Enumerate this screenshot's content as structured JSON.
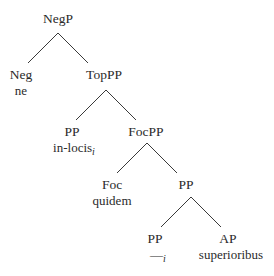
{
  "tree": {
    "nodes": [
      {
        "id": "negp",
        "label": "NegP"
      },
      {
        "id": "neg",
        "label": "Neg",
        "word": "ne"
      },
      {
        "id": "toppp",
        "label": "TopPP"
      },
      {
        "id": "pp1",
        "label": "PP",
        "word": "in-locis",
        "index": "i"
      },
      {
        "id": "focpp",
        "label": "FocPP"
      },
      {
        "id": "foc",
        "label": "Foc",
        "word": "quidem"
      },
      {
        "id": "pp2",
        "label": "PP"
      },
      {
        "id": "pp3",
        "label": "PP",
        "word": "—",
        "index": "i"
      },
      {
        "id": "ap",
        "label": "AP",
        "word": "superioribus"
      }
    ],
    "edges": [
      [
        "negp",
        "neg"
      ],
      [
        "negp",
        "toppp"
      ],
      [
        "toppp",
        "pp1"
      ],
      [
        "toppp",
        "focpp"
      ],
      [
        "focpp",
        "foc"
      ],
      [
        "focpp",
        "pp2"
      ],
      [
        "pp2",
        "pp3"
      ],
      [
        "pp2",
        "ap"
      ]
    ]
  }
}
